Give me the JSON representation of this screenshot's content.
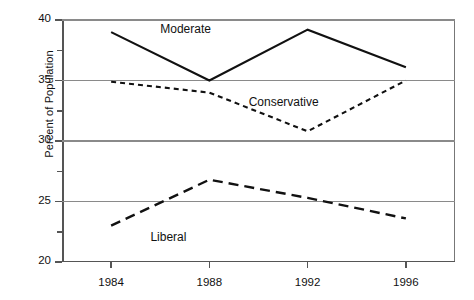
{
  "chart_data": {
    "type": "line",
    "title": "",
    "xlabel": "",
    "ylabel": "Percent of Population",
    "x": [
      1984,
      1988,
      1992,
      1996
    ],
    "categories": [
      "1984",
      "1988",
      "1992",
      "1996"
    ],
    "xlim": [
      1982,
      1998
    ],
    "ylim": [
      20,
      40
    ],
    "y_major_ticks": [
      20,
      25,
      30,
      35,
      40
    ],
    "y_minor_ticks": [
      22.5,
      27.5,
      32.5,
      37.5
    ],
    "y_tick_labels": [
      "20",
      "25",
      "30",
      "35",
      "40"
    ],
    "grid": "horizontal major gridlines only",
    "legend": "inline data labels (no legend box)",
    "series": [
      {
        "name": "Moderate",
        "style": "solid",
        "values": [
          39.0,
          35.0,
          39.2,
          36.1
        ],
        "label_x": 1986.0,
        "label_y": 39.2
      },
      {
        "name": "Conservative",
        "style": "dotted",
        "values": [
          34.9,
          34.0,
          30.8,
          35.0
        ],
        "label_x": 1989.6,
        "label_y": 33.1
      },
      {
        "name": "Liberal",
        "style": "dashed",
        "values": [
          23.0,
          26.8,
          25.3,
          23.6
        ],
        "label_x": 1985.6,
        "label_y": 22.0
      }
    ]
  },
  "axes": {
    "y_title": "Percent of Population"
  }
}
